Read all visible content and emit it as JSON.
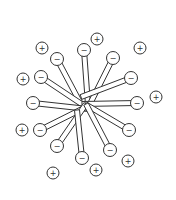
{
  "diagram": {
    "type": "micelle",
    "colors": {
      "stroke": "#333333",
      "fill": "#ffffff"
    },
    "center": [
      85,
      107
    ],
    "head_radius": 6.5,
    "ion_radius": 6,
    "tail_width": 5,
    "head_label": "−",
    "ion_label": "+",
    "surfactants": [
      {
        "head": [
          84,
          50
        ],
        "tail_end": [
          88,
          105
        ]
      },
      {
        "head": [
          113,
          58
        ],
        "tail_end": [
          90,
          104
        ]
      },
      {
        "head": [
          57,
          59
        ],
        "tail_end": [
          83,
          108
        ]
      },
      {
        "head": [
          131,
          78
        ],
        "tail_end": [
          81,
          97
        ]
      },
      {
        "head": [
          41,
          77
        ],
        "tail_end": [
          86,
          107
        ]
      },
      {
        "head": [
          33,
          103
        ],
        "tail_end": [
          88,
          109
        ]
      },
      {
        "head": [
          137,
          103
        ],
        "tail_end": [
          82,
          104
        ]
      },
      {
        "head": [
          40,
          130
        ],
        "tail_end": [
          88,
          106
        ]
      },
      {
        "head": [
          129,
          130
        ],
        "tail_end": [
          85,
          104
        ]
      },
      {
        "head": [
          57,
          146
        ],
        "tail_end": [
          86,
          104
        ]
      },
      {
        "head": [
          110,
          150
        ],
        "tail_end": [
          86,
          104
        ]
      },
      {
        "head": [
          82,
          158
        ],
        "tail_end": [
          77,
          110
        ]
      }
    ],
    "counter_ions": [
      [
        97,
        39
      ],
      [
        42,
        48
      ],
      [
        140,
        48
      ],
      [
        23,
        79
      ],
      [
        156,
        97
      ],
      [
        22,
        130
      ],
      [
        128,
        161
      ],
      [
        96,
        170
      ],
      [
        53,
        173
      ]
    ]
  }
}
